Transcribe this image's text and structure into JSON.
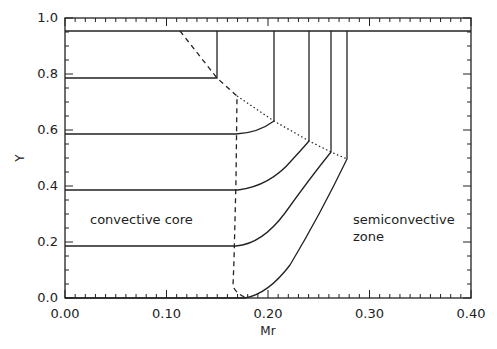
{
  "chart_data": {
    "type": "line",
    "title": "",
    "xlabel": "Mr",
    "ylabel": "Y",
    "xlim": [
      0.0,
      0.4
    ],
    "ylim": [
      0.0,
      1.0
    ],
    "grid": false,
    "legend": null,
    "x_ticks": [
      "0.00",
      "0.10",
      "0.20",
      "0.30",
      "0.40"
    ],
    "y_ticks": [
      "0.0",
      "0.2",
      "0.4",
      "0.6",
      "0.8",
      "1.0"
    ],
    "annotations": [
      {
        "text": "convective core",
        "x": 0.025,
        "y": 0.27
      },
      {
        "text": "semiconvective",
        "x": 0.245,
        "y": 0.27
      },
      {
        "text": "zone",
        "x": 0.245,
        "y": 0.2
      }
    ],
    "series": [
      {
        "name": "top envelope",
        "style": "solid",
        "points": [
          [
            0.0,
            0.955
          ],
          [
            0.4,
            0.955
          ]
        ]
      },
      {
        "name": "profile 1",
        "style": "solid",
        "points": [
          [
            0.0,
            0.79
          ],
          [
            0.15,
            0.79
          ],
          [
            0.15,
            0.955
          ]
        ]
      },
      {
        "name": "profile 2",
        "style": "solid",
        "points": [
          [
            0.0,
            0.59
          ],
          [
            0.17,
            0.59
          ],
          [
            0.185,
            0.6
          ],
          [
            0.206,
            0.636
          ],
          [
            0.206,
            0.955
          ]
        ]
      },
      {
        "name": "profile 3",
        "style": "solid",
        "points": [
          [
            0.0,
            0.39
          ],
          [
            0.172,
            0.39
          ],
          [
            0.195,
            0.42
          ],
          [
            0.22,
            0.48
          ],
          [
            0.24,
            0.56
          ],
          [
            0.24,
            0.955
          ]
        ]
      },
      {
        "name": "profile 4",
        "style": "solid",
        "points": [
          [
            0.0,
            0.19
          ],
          [
            0.17,
            0.19
          ],
          [
            0.19,
            0.22
          ],
          [
            0.215,
            0.3
          ],
          [
            0.24,
            0.4
          ],
          [
            0.262,
            0.52
          ],
          [
            0.262,
            0.955
          ]
        ]
      },
      {
        "name": "profile 5",
        "style": "solid",
        "points": [
          [
            0.0,
            0.0
          ],
          [
            0.177,
            0.0
          ],
          [
            0.195,
            0.03
          ],
          [
            0.215,
            0.11
          ],
          [
            0.24,
            0.24
          ],
          [
            0.262,
            0.37
          ],
          [
            0.278,
            0.495
          ],
          [
            0.278,
            0.955
          ]
        ]
      },
      {
        "name": "convective core boundary",
        "style": "dashed",
        "points": [
          [
            0.113,
            0.955
          ],
          [
            0.15,
            0.79
          ],
          [
            0.17,
            0.725
          ],
          [
            0.168,
            0.4
          ],
          [
            0.165,
            0.1
          ],
          [
            0.166,
            0.02
          ],
          [
            0.18,
            0.0
          ]
        ]
      },
      {
        "name": "semiconvective boundary",
        "style": "dotted",
        "points": [
          [
            0.17,
            0.725
          ],
          [
            0.206,
            0.636
          ],
          [
            0.24,
            0.56
          ],
          [
            0.262,
            0.52
          ],
          [
            0.278,
            0.495
          ]
        ]
      }
    ]
  },
  "plot": {
    "ylabel": "Y",
    "xlabel": "Mr",
    "annot_core": "convective core",
    "annot_semi_1": "semiconvective",
    "annot_semi_2": "zone",
    "xticks": [
      "0.00",
      "0.10",
      "0.20",
      "0.30",
      "0.40"
    ],
    "yticks": [
      "0.0",
      "0.2",
      "0.4",
      "0.6",
      "0.8",
      "1.0"
    ]
  }
}
